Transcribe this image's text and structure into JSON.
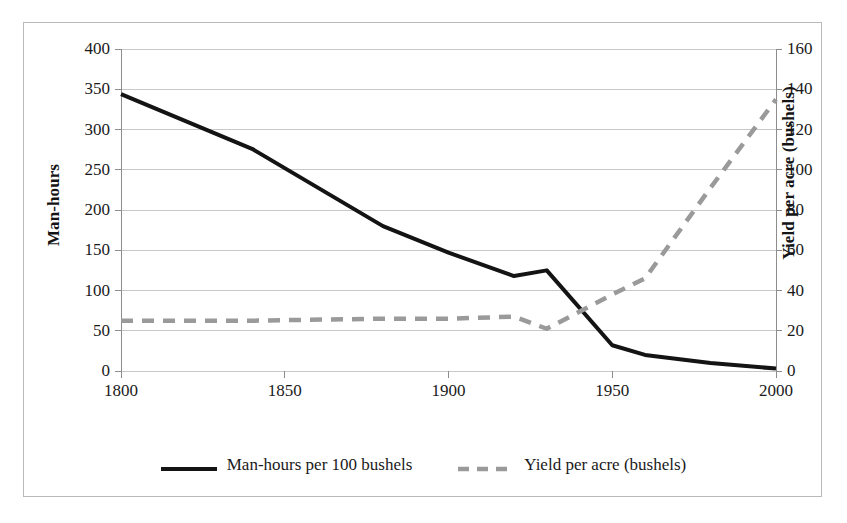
{
  "chart_data": {
    "type": "line",
    "title": "",
    "xlabel": "",
    "ylabel": "Man-hours",
    "y2label": "Yield per acre (bushels)",
    "xlim": [
      1800,
      2000
    ],
    "ylim": [
      0,
      400
    ],
    "y2lim": [
      0,
      160
    ],
    "grid": true,
    "legend_position": "bottom",
    "x_ticks": [
      "1800",
      "1850",
      "1900",
      "1950",
      "2000"
    ],
    "y_ticks": [
      "0",
      "50",
      "100",
      "150",
      "200",
      "250",
      "300",
      "350",
      "400"
    ],
    "y2_ticks": [
      "0",
      "20",
      "40",
      "60",
      "80",
      "100",
      "120",
      "140",
      "160"
    ],
    "series": [
      {
        "name": "Man-hours per 100 bushels",
        "axis": "left",
        "style": "solid",
        "color": "#141414",
        "x": [
          1800,
          1840,
          1880,
          1900,
          1920,
          1930,
          1950,
          1960,
          1980,
          2000
        ],
        "values": [
          344,
          276,
          180,
          147,
          118,
          125,
          32,
          20,
          10,
          3
        ]
      },
      {
        "name": "Yield per acre (bushels)",
        "axis": "right",
        "style": "dashed",
        "color": "#9a9a9a",
        "x": [
          1800,
          1840,
          1880,
          1900,
          1920,
          1930,
          1950,
          1960,
          1980,
          2000
        ],
        "values": [
          25,
          25,
          26,
          26,
          27,
          21,
          38,
          46,
          91,
          135
        ]
      }
    ]
  },
  "axes": {
    "left_title": "Man-hours",
    "right_title": "Yield per acre (bushels)"
  },
  "legend": {
    "items": [
      {
        "label": "Man-hours per 100 bushels",
        "style": "solid",
        "color": "#141414"
      },
      {
        "label": "Yield per acre (bushels)",
        "style": "dashed",
        "color": "#9a9a9a"
      }
    ]
  },
  "style": {
    "frame_border": "#b9b9b9",
    "gridline": "#c8c8c8",
    "axis_line": "#8d8d8d",
    "background": "#ffffff"
  }
}
